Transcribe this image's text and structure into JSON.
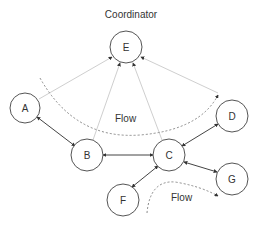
{
  "title": "Coordinator",
  "flow_labels": [
    "Flow",
    "Flow"
  ],
  "nodes": [
    {
      "id": "A",
      "label": "A",
      "cx": 25,
      "cy": 108
    },
    {
      "id": "B",
      "label": "B",
      "cx": 87,
      "cy": 155
    },
    {
      "id": "C",
      "label": "C",
      "cx": 169,
      "cy": 155
    },
    {
      "id": "D",
      "label": "D",
      "cx": 232,
      "cy": 116
    },
    {
      "id": "E",
      "label": "E",
      "cx": 126,
      "cy": 47
    },
    {
      "id": "F",
      "label": "F",
      "cx": 123,
      "cy": 200
    },
    {
      "id": "G",
      "label": "G",
      "cx": 232,
      "cy": 179
    }
  ],
  "edges": [
    {
      "from": "A",
      "to": "B",
      "style": "solid",
      "arrows": "both"
    },
    {
      "from": "B",
      "to": "C",
      "style": "solid",
      "arrows": "both"
    },
    {
      "from": "C",
      "to": "D",
      "style": "solid",
      "arrows": "both"
    },
    {
      "from": "C",
      "to": "G",
      "style": "solid",
      "arrows": "both"
    },
    {
      "from": "F",
      "to": "C",
      "style": "solid",
      "arrows": "both"
    },
    {
      "from": "A",
      "to": "E",
      "style": "light",
      "arrows": "end"
    },
    {
      "from": "B",
      "to": "E",
      "style": "light",
      "arrows": "end"
    },
    {
      "from": "C",
      "to": "E",
      "style": "light",
      "arrows": "end"
    },
    {
      "from": "D",
      "to": "E",
      "style": "light",
      "arrows": "end"
    }
  ],
  "colors": {
    "node_stroke": "#555555",
    "edge": "#444444",
    "light_edge": "#cccccc",
    "dashed": "#888888"
  }
}
